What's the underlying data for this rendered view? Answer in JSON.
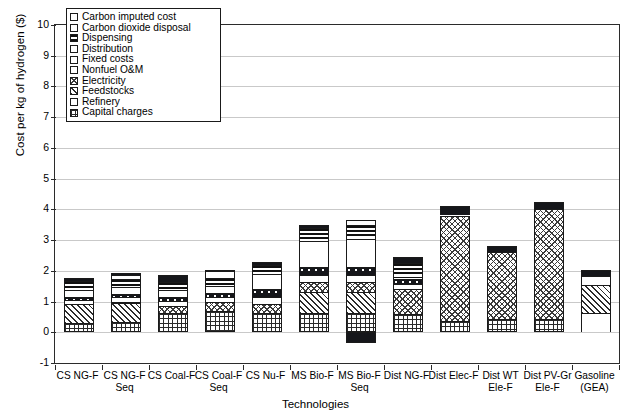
{
  "chart_data": {
    "type": "bar",
    "stacked": true,
    "title": "",
    "xlabel": "Technologies",
    "ylabel": "Cost per kg of hydrogen ($)",
    "ylim": [
      -1,
      10
    ],
    "yticks": [
      -1,
      0,
      1,
      2,
      3,
      4,
      5,
      6,
      7,
      8,
      9,
      10
    ],
    "ytick_labels": [
      "-1",
      "0",
      "1",
      "2",
      "3",
      "4",
      "5",
      "6",
      "7",
      "8",
      "9",
      "10"
    ],
    "grid": true,
    "legend_position": "top-left",
    "categories": [
      "CS NG-F",
      "CS NG-F\nSeq",
      "CS Coal-F",
      "CS Coal-F\nSeq",
      "CS Nu-F",
      "MS Bio-F",
      "MS Bio-F\nSeq",
      "Dist NG-F",
      "Dist Elec-F",
      "Dist WT\nEle-F",
      "Dist PV-Gr\nEle-F",
      "Gasoline\n(GEA)"
    ],
    "series": [
      {
        "name": "Capital charges",
        "pattern": "grid",
        "values": [
          0.3,
          0.33,
          0.62,
          0.7,
          0.62,
          0.62,
          0.62,
          0.58,
          0.38,
          0.42,
          0.44,
          0.0
        ]
      },
      {
        "name": "Refinery",
        "pattern": "white",
        "values": [
          0.0,
          0.0,
          0.0,
          0.0,
          0.0,
          0.0,
          0.0,
          0.0,
          0.0,
          0.0,
          0.0,
          0.62
        ]
      },
      {
        "name": "Feedstocks",
        "pattern": "diag",
        "values": [
          0.62,
          0.62,
          0.0,
          0.0,
          0.0,
          0.7,
          0.7,
          0.0,
          0.0,
          0.0,
          0.0,
          0.92
        ]
      },
      {
        "name": "Electricity",
        "pattern": "crossdot",
        "values": [
          0.0,
          0.05,
          0.22,
          0.28,
          0.3,
          0.3,
          0.3,
          0.82,
          3.42,
          2.18,
          3.58,
          0.0
        ]
      },
      {
        "name": "Nonfuel O&M",
        "pattern": "white",
        "values": [
          0.14,
          0.14,
          0.18,
          0.18,
          0.22,
          0.24,
          0.24,
          0.18,
          0.0,
          0.0,
          0.0,
          0.3
        ]
      },
      {
        "name": "Fixed costs",
        "pattern": "dots",
        "values": [
          0.1,
          0.1,
          0.12,
          0.12,
          0.26,
          0.28,
          0.28,
          0.14,
          0.0,
          0.0,
          0.0,
          0.0
        ]
      },
      {
        "name": "Distribution",
        "pattern": "white",
        "values": [
          0.22,
          0.22,
          0.22,
          0.22,
          0.5,
          0.82,
          0.9,
          0.0,
          0.0,
          0.0,
          0.0,
          0.0
        ]
      },
      {
        "name": "Dispensing",
        "pattern": "hlines",
        "values": [
          0.28,
          0.28,
          0.28,
          0.28,
          0.3,
          0.42,
          0.44,
          0.54,
          0.0,
          0.0,
          0.0,
          0.0
        ]
      },
      {
        "name": "Carbon dioxide disposal",
        "pattern": "white",
        "values": [
          0.0,
          0.14,
          0.0,
          0.2,
          0.0,
          0.0,
          0.18,
          0.0,
          0.0,
          0.0,
          0.0,
          0.0
        ]
      },
      {
        "name": "Carbon imputed cost",
        "pattern": "solid",
        "values": [
          0.1,
          0.04,
          0.22,
          0.06,
          0.08,
          0.1,
          -0.35,
          0.18,
          0.3,
          0.2,
          0.22,
          0.18
        ]
      }
    ],
    "totals": [
      1.76,
      1.88,
      1.86,
      2.04,
      2.28,
      3.48,
      3.66,
      2.44,
      4.1,
      2.8,
      4.24,
      2.02
    ]
  },
  "legend": {
    "items": [
      {
        "label": "Carbon imputed cost",
        "pattern": "solid"
      },
      {
        "label": "Carbon dioxide disposal",
        "pattern": "white"
      },
      {
        "label": "Dispensing",
        "pattern": "hlines"
      },
      {
        "label": "Distribution",
        "pattern": "white"
      },
      {
        "label": "Fixed costs",
        "pattern": "dots"
      },
      {
        "label": "Nonfuel O&M",
        "pattern": "white"
      },
      {
        "label": "Electricity",
        "pattern": "crossdot"
      },
      {
        "label": "Feedstocks",
        "pattern": "diag"
      },
      {
        "label": "Refinery",
        "pattern": "white"
      },
      {
        "label": "Capital charges",
        "pattern": "grid"
      }
    ]
  }
}
